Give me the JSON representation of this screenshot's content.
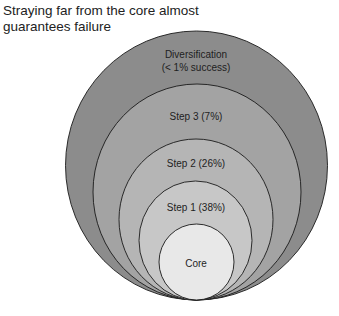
{
  "title": "Straying far from the core almost guarantees failure",
  "rings": [
    {
      "id": "diversification",
      "label_line1": "Diversification",
      "label_line2": "(< 1% success)",
      "fill": "#8c8c8c",
      "cx": 196.5,
      "cy": 165.5,
      "rx": 131,
      "ry": 134.5
    },
    {
      "id": "step-3",
      "label_line1": "Step 3 (7%)",
      "fill": "#a3a3a3",
      "cx": 197,
      "cy": 192,
      "rx": 104,
      "ry": 108
    },
    {
      "id": "step-2",
      "label_line1": "Step 2 (26%)",
      "fill": "#b5b5b5",
      "cx": 196,
      "cy": 219.5,
      "rx": 77,
      "ry": 80.5
    },
    {
      "id": "step-1",
      "label_line1": "Step 1 (38%)",
      "fill": "#c7c7c7",
      "cx": 195.5,
      "cy": 240.5,
      "rx": 56.5,
      "ry": 59.5
    },
    {
      "id": "core",
      "label_line1": "Core",
      "fill": "#e8e8e8",
      "cx": 196.5,
      "cy": 262,
      "rx": 37.5,
      "ry": 38
    }
  ],
  "stroke_color": "#1a1a1a"
}
